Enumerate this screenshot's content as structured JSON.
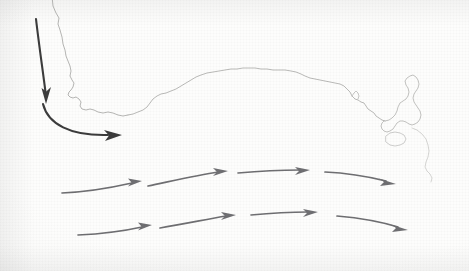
{
  "figure": {
    "width": 469,
    "height": 271,
    "background_color": "#fdfdfc"
  },
  "colors": {
    "coastline": "#b0b0ae",
    "coastline_faint": "#c6c6c4",
    "dark_arrow": "#3c3c3c",
    "grey_arrow": "#6f6f72",
    "paper": "#fdfdfc"
  },
  "coastlines": [
    {
      "name": "west-coast-southwest-australia",
      "label": "Western Australia south-west coast",
      "stroke": "#aeaeac",
      "stroke_width": 0.9,
      "d": "M 52 -4 L 53 6 L 56 13 L 59 18 L 58 24 L 60 30 L 62 37 L 63 44 L 65 50 L 66 56 L 68 61 L 70 66 L 71 71 L 70 76 L 72 80 L 74 83 L 73 87 L 71 90 L 69 92 L 68 95 L 70 97 L 73 98 L 76 97 L 79 99 L 81 102 L 80 106 L 82 109 L 86 110 L 90 109 L 94 110 L 98 112 L 103 113 L 108 112 L 113 113 L 118 115 L 123 116 L 128 115"
    },
    {
      "name": "south-coast-great-australian-bight",
      "label": "Great Australian Bight coastline",
      "stroke": "#b2b2b0",
      "stroke_width": 0.9,
      "d": "M 128 115 L 133 114 L 138 112 L 143 110 L 147 107 L 150 103 L 153 99 L 157 96 L 161 94 L 166 93 L 171 91 L 176 89 L 181 86 L 186 83 L 191 80 L 196 77 L 201 75 L 207 73 L 213 72 L 219 71 L 225 70 L 231 69 L 237 69 L 243 68 L 249 68 L 255 68 L 261 69 L 267 69 L 273 70 L 279 70 L 285 70 L 291 71 L 296 72 L 301 74 L 305 76 L 310 78 L 315 79 L 320 80 L 325 81 L 330 82 L 335 83 L 340 84 L 344 86 L 347 89 L 350 92 L 352 96 L 355 99 L 358 100 L 361 102 L 364 103 L 366 106 L 368 109 L 371 111 L 374 113 L 376 116 L 379 118 L 382 120 L 385 121"
    },
    {
      "name": "tasmania-north-west",
      "label": "Tasmania north-west headland",
      "stroke": "#bcbcba",
      "stroke_width": 0.9,
      "d": "M 385 121 L 389 120 L 392 118 L 395 115 L 397 111 L 398 107 L 400 103 L 403 101 L 406 99 L 408 96 L 409 92 L 408 88 L 406 85 L 405 81 L 407 78 L 410 76 L 413 75 L 416 77 L 418 80 L 419 84 L 418 88 L 416 91 L 414 94 L 413 98 L 414 102 L 416 105 L 418 108 L 420 111 L 421 115 L 420 119 L 418 122 L 415 124 L 412 125 L 409 124 L 406 122 L 403 121 L 400 121 L 397 123 L 395 126 L 393 129 L 390 131 L 387 132 L 384 131 L 382 129 L 381 126 L 382 123 L 384 121 Z"
    },
    {
      "name": "bass-strait-islet",
      "label": "Bass Strait islet",
      "stroke": "#c2c2c0",
      "stroke_width": 0.8,
      "d": "M 386 136 L 390 133 L 395 132 L 400 133 L 404 135 L 406 139 L 404 143 L 400 145 L 395 146 L 390 145 L 386 142 Z"
    },
    {
      "name": "tasmania-east-coast-fragment",
      "label": "Tasmania east coast faint fragment",
      "stroke": "#cacac8",
      "stroke_width": 0.8,
      "d": "M 412 128 L 417 130 L 422 134 L 426 139 L 428 145 L 429 151 L 428 157 L 426 162 L 425 167 L 427 171 L 430 174 L 432 178 L 431 182"
    },
    {
      "name": "south-australia-gulf-notch",
      "label": "South Australia gulf notch",
      "stroke": "#b8b8b6",
      "stroke_width": 0.8,
      "d": "M 352 96 L 354 93 L 356 91 L 358 93 L 359 96 L 358 99"
    }
  ],
  "arrows": {
    "dark": [
      {
        "name": "leeuwin-current-inflow-arrow",
        "label": "Southward inflow arrow (west coast)",
        "color": "#3c3c3c",
        "stroke_width": 2.1,
        "head_size": 9,
        "path": "M 36 19 C 39 45, 43 72, 46 96",
        "head_points": "46,104 41.5,88 46.3,91.5 51,87"
      },
      {
        "name": "leeuwin-current-turn-arrow",
        "label": "Eastward turning arrow around Cape Leeuwin",
        "color": "#3c3c3c",
        "stroke_width": 2.1,
        "head_size": 9,
        "path": "M 43 104 C 48 124, 70 136, 108 135",
        "head_points": "122,135 105,141 109,135.5 104,130"
      }
    ],
    "rows": [
      {
        "name": "current-row-upper",
        "label": "Upper eastward current band",
        "color": "#6f6f72",
        "stroke_width": 1.7,
        "head_size": 7.5,
        "segments": [
          {
            "name": "row1-seg1",
            "path": "M 62 193 C 85 192, 110 188, 132 183",
            "head_points": "142,181 128,186.5 131.5,182.5 128,178.5"
          },
          {
            "name": "row1-seg2",
            "path": "M 148 186 C 172 181, 198 175, 218 172",
            "head_points": "228,171 213,176 217,172 213,168"
          },
          {
            "name": "row1-seg3",
            "path": "M 238 173 C 260 171, 282 170, 300 170",
            "head_points": "310,170 295,175 299,171 295,167"
          },
          {
            "name": "row1-seg4",
            "path": "M 325 172 C 348 173, 370 177, 386 181",
            "head_points": "396,184 380,186 384,182 379,178.5"
          }
        ]
      },
      {
        "name": "current-row-lower",
        "label": "Lower eastward current band",
        "color": "#6f6f72",
        "stroke_width": 1.7,
        "head_size": 7.5,
        "segments": [
          {
            "name": "row2-seg1",
            "path": "M 78 235 C 100 234, 124 231, 142 227",
            "head_points": "152,225 138,230.5 141.5,226.5 138,222.5"
          },
          {
            "name": "row2-seg2",
            "path": "M 160 228 C 184 224, 208 219, 226 216",
            "head_points": "236,215 221,220 225,216 221,212"
          },
          {
            "name": "row2-seg3",
            "path": "M 251 215 C 272 213, 292 212, 308 212",
            "head_points": "318,212 303,217 307,213 303,209"
          },
          {
            "name": "row2-seg4",
            "path": "M 337 216 C 360 218, 382 222, 398 227",
            "head_points": "408,230 392,232 396,228 391,224.5"
          }
        ]
      }
    ]
  }
}
